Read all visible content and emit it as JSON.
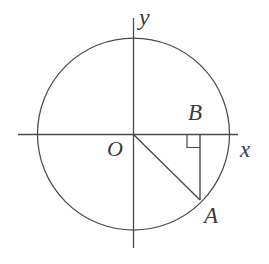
{
  "figure": {
    "background_color": "#ffffff",
    "stroke_color": "#4a4a4a",
    "label_color": "#3a3a3a",
    "labels": {
      "x_axis": "x",
      "y_axis": "y",
      "origin": "O",
      "point_b": "B",
      "point_a": "A"
    },
    "geometry": {
      "circle": {
        "center_x": 133.5,
        "center_y": 134,
        "radius": 96
      },
      "x_axis": {
        "x1": 18,
        "y1": 134,
        "x2": 238,
        "y2": 134
      },
      "y_axis": {
        "x1": 133.5,
        "y1": 18,
        "x2": 133.5,
        "y2": 248
      },
      "point_A": {
        "x": 200,
        "y": 200
      },
      "point_B": {
        "x": 200,
        "y": 134
      },
      "segment_OA": {
        "x1": 133.5,
        "y1": 134,
        "x2": 200,
        "y2": 200
      },
      "segment_BA": {
        "x1": 200,
        "y1": 134,
        "x2": 200,
        "y2": 200
      },
      "right_angle_marker": {
        "x": 187,
        "y": 134,
        "size": 13
      }
    }
  }
}
